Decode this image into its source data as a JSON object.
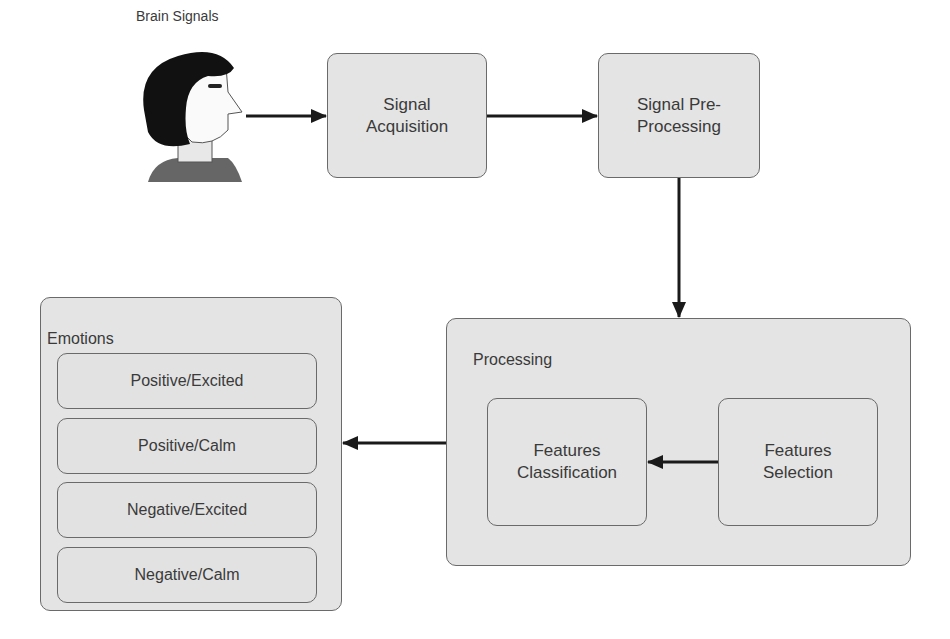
{
  "diagram": {
    "source": {
      "label": "Brain Signals",
      "icon": "person-head-icon"
    },
    "nodes": {
      "signal_acquisition": "Signal\nAcquisition",
      "signal_preprocessing": "Signal Pre-\nProcessing",
      "processing": {
        "title": "Processing",
        "features_classification": "Features\nClassification",
        "features_selection": "Features\nSelection"
      },
      "emotions": {
        "title": "Emotions",
        "items": [
          "Positive/Excited",
          "Positive/Calm",
          "Negative/Excited",
          "Negative/Calm"
        ]
      }
    },
    "edges": [
      {
        "from": "Brain Signals",
        "to": "Signal Acquisition"
      },
      {
        "from": "Signal Acquisition",
        "to": "Signal Pre-Processing"
      },
      {
        "from": "Signal Pre-Processing",
        "to": "Processing"
      },
      {
        "from": "Features Selection",
        "to": "Features Classification"
      },
      {
        "from": "Processing",
        "to": "Emotions"
      }
    ],
    "colors": {
      "box_fill": "#e4e4e4",
      "border": "#6a6a6a",
      "arrow": "#1a1a1a"
    }
  }
}
